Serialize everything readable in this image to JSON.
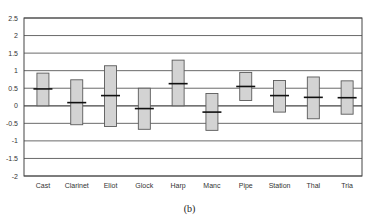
{
  "chart_data": {
    "type": "bar",
    "subtype": "floating-range-with-mean",
    "title": "",
    "caption": "(b)",
    "xlabel": "",
    "ylabel": "",
    "ylim": [
      -2,
      2.5
    ],
    "yticks": [
      "2.5",
      "2",
      "1.5",
      "1",
      "0.5",
      "0",
      "-0.5",
      "-1",
      "-1.5",
      "-2"
    ],
    "ytick_values": [
      2.5,
      2,
      1.5,
      1,
      0.5,
      0,
      -0.5,
      -1,
      -1.5,
      -2
    ],
    "grid": true,
    "legend": null,
    "categories": [
      "Cast",
      "Clarinet",
      "Eliot",
      "Glock",
      "Harp",
      "Manc",
      "Pipe",
      "Station",
      "Thal",
      "Tria"
    ],
    "series": [
      {
        "name": "high",
        "values": [
          0.93,
          0.74,
          1.14,
          0.5,
          1.3,
          0.35,
          0.95,
          0.72,
          0.82,
          0.71
        ]
      },
      {
        "name": "low",
        "values": [
          0.0,
          -0.54,
          -0.59,
          -0.67,
          0.0,
          -0.7,
          0.15,
          -0.18,
          -0.37,
          -0.24
        ]
      },
      {
        "name": "mean",
        "values": [
          0.48,
          0.09,
          0.29,
          -0.08,
          0.63,
          -0.18,
          0.55,
          0.29,
          0.24,
          0.23
        ]
      }
    ],
    "colors": {
      "box_fill": "#d3d3d3",
      "box_border": "#5a5a5a",
      "mean_line": "#111111",
      "grid": "#444444",
      "frame": "#444444"
    }
  }
}
